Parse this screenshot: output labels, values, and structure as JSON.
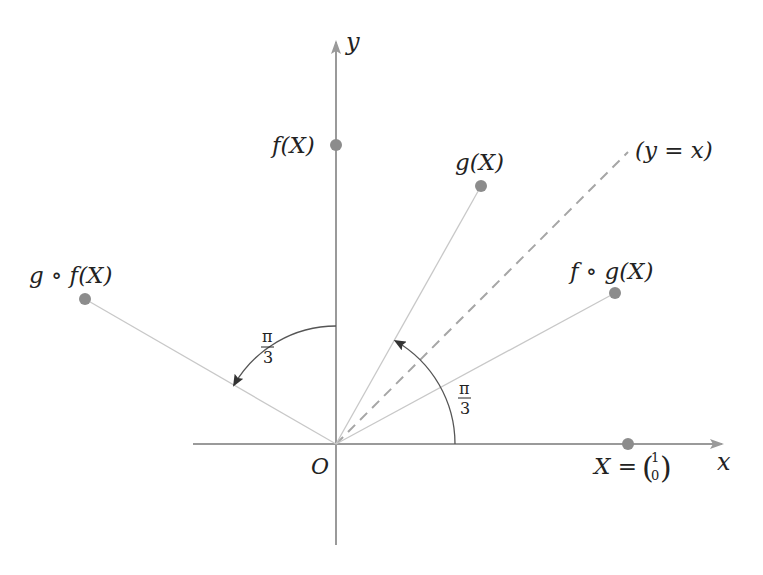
{
  "diagram": {
    "axes": {
      "x_label": "x",
      "y_label": "y",
      "origin_label": "O",
      "axis_color": "#9a9a9a"
    },
    "points": [
      {
        "id": "X",
        "label": "X = (1 0)",
        "label_prefix": "X =",
        "vector_top": "1",
        "vector_bottom": "0",
        "angle_deg": 0
      },
      {
        "id": "f_X",
        "label": "f(X)",
        "angle_deg": 90
      },
      {
        "id": "g_X",
        "label": "g(X)",
        "angle_deg": 60
      },
      {
        "id": "f_of_g_X",
        "label": "f ∘ g(X)",
        "angle_deg": 30
      },
      {
        "id": "g_of_f_X",
        "label": "g ∘ f(X)",
        "angle_deg": 150
      }
    ],
    "diagonal": {
      "label": "(y = x)",
      "style": "dashed"
    },
    "angles": [
      {
        "id": "rotation-from-x",
        "label_num": "π",
        "label_den": "3",
        "from_deg": 0,
        "to_deg": 60
      },
      {
        "id": "rotation-from-y",
        "label_num": "π",
        "label_den": "3",
        "from_deg": 90,
        "to_deg": 150
      }
    ],
    "colors": {
      "point": "#8c8c8c",
      "line": "#c8c8c8",
      "dashed": "#a6a6a6",
      "arc": "#555555",
      "text": "#222222"
    }
  }
}
